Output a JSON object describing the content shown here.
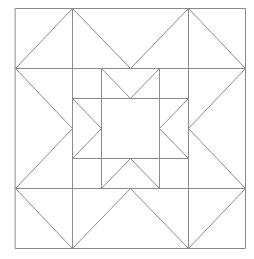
{
  "diagram": {
    "stroke_color": "#8a8a8a",
    "stroke_width": 1,
    "outer_square": {
      "x1": 15,
      "y1": 8,
      "x2": 245,
      "y2": 248
    },
    "grid": {
      "x": [
        15,
        72,
        101,
        130,
        159,
        188,
        245
      ],
      "y": [
        8,
        68,
        98,
        128,
        158,
        188,
        248
      ]
    },
    "lines": [
      {
        "name": "h-line-upper",
        "points": [
          [
            15,
            68
          ],
          [
            245,
            68
          ]
        ]
      },
      {
        "name": "h-line-lower",
        "points": [
          [
            15,
            188
          ],
          [
            245,
            188
          ]
        ]
      },
      {
        "name": "v-line-left",
        "points": [
          [
            72,
            8
          ],
          [
            72,
            248
          ]
        ]
      },
      {
        "name": "v-line-right",
        "points": [
          [
            188,
            8
          ],
          [
            188,
            248
          ]
        ]
      },
      {
        "name": "inner-h-top",
        "points": [
          [
            72,
            98
          ],
          [
            188,
            98
          ]
        ]
      },
      {
        "name": "inner-h-bottom",
        "points": [
          [
            72,
            158
          ],
          [
            188,
            158
          ]
        ]
      },
      {
        "name": "inner-v-left",
        "points": [
          [
            101,
            68
          ],
          [
            101,
            188
          ]
        ]
      },
      {
        "name": "inner-v-right",
        "points": [
          [
            159,
            68
          ],
          [
            159,
            188
          ]
        ]
      }
    ],
    "polylines": [
      {
        "name": "top-chevron",
        "points": [
          [
            72,
            8
          ],
          [
            130,
            68
          ],
          [
            188,
            8
          ]
        ]
      },
      {
        "name": "bottom-chevron",
        "points": [
          [
            72,
            248
          ],
          [
            130,
            188
          ],
          [
            188,
            248
          ]
        ]
      },
      {
        "name": "left-chevron",
        "points": [
          [
            15,
            68
          ],
          [
            72,
            128
          ],
          [
            15,
            188
          ]
        ]
      },
      {
        "name": "right-chevron",
        "points": [
          [
            245,
            68
          ],
          [
            188,
            128
          ],
          [
            245,
            188
          ]
        ]
      },
      {
        "name": "inner-top-chevron",
        "points": [
          [
            101,
            68
          ],
          [
            130,
            98
          ],
          [
            159,
            68
          ]
        ]
      },
      {
        "name": "inner-bottom-chevron",
        "points": [
          [
            101,
            188
          ],
          [
            130,
            158
          ],
          [
            159,
            188
          ]
        ]
      },
      {
        "name": "inner-left-chevron",
        "points": [
          [
            72,
            98
          ],
          [
            101,
            128
          ],
          [
            72,
            158
          ]
        ]
      },
      {
        "name": "inner-right-chevron",
        "points": [
          [
            188,
            98
          ],
          [
            159,
            128
          ],
          [
            188,
            158
          ]
        ]
      },
      {
        "name": "corner-top-left-diagonal",
        "points": [
          [
            15,
            68
          ],
          [
            72,
            8
          ]
        ]
      },
      {
        "name": "corner-top-right-diagonal",
        "points": [
          [
            188,
            8
          ],
          [
            245,
            68
          ]
        ]
      },
      {
        "name": "corner-bottom-left-diagonal",
        "points": [
          [
            15,
            188
          ],
          [
            72,
            248
          ]
        ]
      },
      {
        "name": "corner-bottom-right-diagonal",
        "points": [
          [
            245,
            188
          ],
          [
            188,
            248
          ]
        ]
      }
    ]
  }
}
